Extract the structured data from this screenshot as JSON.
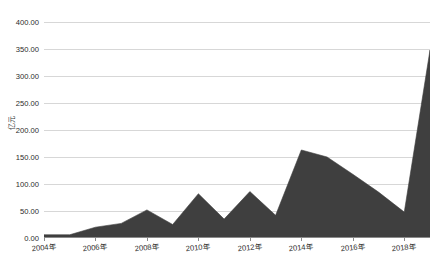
{
  "chart_data": {
    "type": "area",
    "title": "",
    "xlabel": "",
    "ylabel": "亿元",
    "ylim": [
      0,
      400
    ],
    "ytick_step": 50,
    "ytick_labels": [
      "0.00",
      "50.00",
      "100.00",
      "150.00",
      "200.00",
      "250.00",
      "300.00",
      "350.00",
      "400.00"
    ],
    "ytick_values": [
      0,
      50,
      100,
      150,
      200,
      250,
      300,
      350,
      400
    ],
    "grid": true,
    "legend": "none",
    "fill_color": "#3f3f3f",
    "line_color": "#3f3f3f",
    "gridline_color": "#d7d7d7",
    "axis_color": "#8a8a8a",
    "categories": [
      "2004年",
      "2005年",
      "2006年",
      "2007年",
      "2008年",
      "2009年",
      "2010年",
      "2011年",
      "2012年",
      "2013年",
      "2014年",
      "2015年",
      "2016年",
      "2017年",
      "2018年",
      "2019年"
    ],
    "xtick_labels": [
      "2004年",
      "2006年",
      "2008年",
      "2010年",
      "2012年",
      "2014年",
      "2016年",
      "2018年"
    ],
    "xtick_indices": [
      0,
      2,
      4,
      6,
      8,
      10,
      12,
      14
    ],
    "values": [
      6,
      6,
      20,
      27,
      52,
      25,
      82,
      35,
      86,
      42,
      163,
      150,
      118,
      85,
      48,
      348
    ]
  },
  "meta": {
    "units_label": "亿元"
  }
}
